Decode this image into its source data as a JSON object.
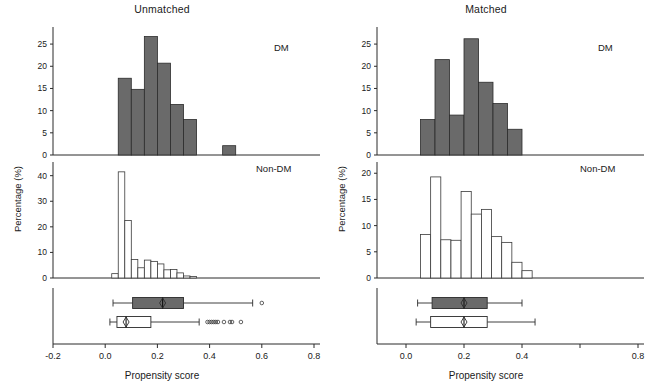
{
  "figure": {
    "xlabel": "Propensity score",
    "ylabel": "Percentage (%)",
    "group_dm": "DM",
    "group_nondm": "Non-DM"
  },
  "panels": [
    {
      "key": "unmatched",
      "title": "Unmatched",
      "xlim": [
        -0.2,
        0.8
      ],
      "xticks": [
        -0.2,
        0.0,
        0.2,
        0.4,
        0.6,
        0.8
      ],
      "xticklabels": [
        "-0.2",
        "0.0",
        "0.2",
        "0.4",
        "0.6",
        "0.8"
      ],
      "hist_dm": {
        "ylim": [
          0,
          27.5
        ],
        "yticks": [
          0,
          5,
          10,
          15,
          20,
          25
        ],
        "yticklabels": [
          "0",
          "5",
          "10",
          "15",
          "20",
          "25"
        ],
        "bin_width": 0.05,
        "bins_left": [
          0.05,
          0.1,
          0.15,
          0.2,
          0.25,
          0.3,
          0.45
        ],
        "values": [
          17.3,
          14.8,
          26.7,
          20.7,
          11.4,
          8.0,
          2.1
        ]
      },
      "hist_nondm": {
        "ylim": [
          0,
          43
        ],
        "yticks": [
          0,
          10,
          20,
          30,
          40
        ],
        "yticklabels": [
          "0",
          "10",
          "20",
          "30",
          "40"
        ],
        "bin_width": 0.025,
        "bins_left": [
          0.025,
          0.05,
          0.075,
          0.1,
          0.125,
          0.15,
          0.175,
          0.2,
          0.225,
          0.25,
          0.275,
          0.3,
          0.325
        ],
        "values": [
          1.7,
          41.5,
          22.5,
          7.2,
          4.0,
          7.0,
          6.5,
          5.5,
          3.2,
          3.3,
          2.0,
          0.8,
          0.6
        ]
      },
      "box_dm": {
        "whisker_low": 0.03,
        "q1": 0.105,
        "median": 0.22,
        "q3": 0.3,
        "whisker_high": 0.565,
        "outliers": [
          0.6
        ]
      },
      "box_nondm": {
        "whisker_low": 0.018,
        "q1": 0.045,
        "median": 0.08,
        "q3": 0.175,
        "whisker_high": 0.36,
        "outliers": [
          0.392,
          0.4,
          0.408,
          0.416,
          0.424,
          0.432,
          0.455,
          0.478,
          0.486,
          0.52
        ]
      }
    },
    {
      "key": "matched",
      "title": "Matched",
      "xlim": [
        -0.1,
        0.8
      ],
      "xticks": [
        0.0,
        0.2,
        0.4,
        0.6,
        0.8
      ],
      "xticklabels": [
        "0.0",
        "0.2",
        "0.4",
        "",
        "0.8"
      ],
      "hist_dm": {
        "ylim": [
          0,
          27.5
        ],
        "yticks": [
          0,
          5,
          10,
          15,
          20,
          25
        ],
        "yticklabels": [
          "0",
          "5",
          "10",
          "15",
          "20",
          "25"
        ],
        "bin_width": 0.05,
        "bins_left": [
          0.05,
          0.1,
          0.15,
          0.2,
          0.25,
          0.3,
          0.35
        ],
        "values": [
          8.0,
          21.5,
          9.0,
          26.2,
          16.4,
          11.6,
          5.8
        ]
      },
      "hist_nondm": {
        "ylim": [
          0,
          21
        ],
        "yticks": [
          0,
          5,
          10,
          15,
          20
        ],
        "yticklabels": [
          "0",
          "5",
          "10",
          "15",
          "20"
        ],
        "bin_width": 0.035,
        "bins_left": [
          0.05,
          0.085,
          0.12,
          0.155,
          0.19,
          0.225,
          0.26,
          0.295,
          0.33,
          0.365,
          0.4
        ],
        "values": [
          8.3,
          19.3,
          7.3,
          7.2,
          16.5,
          12.2,
          13.1,
          7.9,
          6.8,
          3.0,
          1.4
        ]
      },
      "box_dm": {
        "whisker_low": 0.04,
        "q1": 0.09,
        "median": 0.2,
        "q3": 0.28,
        "whisker_high": 0.4,
        "outliers": []
      },
      "box_nondm": {
        "whisker_low": 0.035,
        "q1": 0.085,
        "median": 0.2,
        "q3": 0.28,
        "whisker_high": 0.445,
        "outliers": []
      }
    }
  ],
  "chart_data": {
    "type": "bar",
    "xlabel": "Propensity score",
    "ylabel": "Percentage (%)",
    "grid": false,
    "legend": "in-plot text tags (DM / Non-DM)",
    "subplots": [
      {
        "panel": "Unmatched",
        "row": "DM",
        "type": "bar",
        "xlim": [
          -0.2,
          0.8
        ],
        "ylim": [
          0,
          27.5
        ],
        "bin_width": 0.05,
        "categories": [
          "0.05-0.10",
          "0.10-0.15",
          "0.15-0.20",
          "0.20-0.25",
          "0.25-0.30",
          "0.30-0.35",
          "0.45-0.50"
        ],
        "values": [
          17.3,
          14.8,
          26.7,
          20.7,
          11.4,
          8.0,
          2.1
        ]
      },
      {
        "panel": "Unmatched",
        "row": "Non-DM",
        "type": "bar",
        "xlim": [
          -0.2,
          0.8
        ],
        "ylim": [
          0,
          43
        ],
        "bin_width": 0.025,
        "categories": [
          "0.025",
          "0.050",
          "0.075",
          "0.100",
          "0.125",
          "0.150",
          "0.175",
          "0.200",
          "0.225",
          "0.250",
          "0.275",
          "0.300",
          "0.325"
        ],
        "values": [
          1.7,
          41.5,
          22.5,
          7.2,
          4.0,
          7.0,
          6.5,
          5.5,
          3.2,
          3.3,
          2.0,
          0.8,
          0.6
        ]
      },
      {
        "panel": "Matched",
        "row": "DM",
        "type": "bar",
        "xlim": [
          -0.1,
          0.8
        ],
        "ylim": [
          0,
          27.5
        ],
        "bin_width": 0.05,
        "categories": [
          "0.05-0.10",
          "0.10-0.15",
          "0.15-0.20",
          "0.20-0.25",
          "0.25-0.30",
          "0.30-0.35",
          "0.35-0.40"
        ],
        "values": [
          8.0,
          21.5,
          9.0,
          26.2,
          16.4,
          11.6,
          5.8
        ]
      },
      {
        "panel": "Matched",
        "row": "Non-DM",
        "type": "bar",
        "xlim": [
          -0.1,
          0.8
        ],
        "ylim": [
          0,
          21
        ],
        "bin_width": 0.035,
        "categories": [
          "0.050",
          "0.085",
          "0.120",
          "0.155",
          "0.190",
          "0.225",
          "0.260",
          "0.295",
          "0.330",
          "0.365",
          "0.400"
        ],
        "values": [
          8.3,
          19.3,
          7.3,
          7.2,
          16.5,
          12.2,
          13.1,
          7.9,
          6.8,
          3.0,
          1.4
        ]
      }
    ],
    "boxplots": [
      {
        "panel": "Unmatched",
        "row": "DM",
        "whisker_low": 0.03,
        "q1": 0.105,
        "median": 0.22,
        "q3": 0.3,
        "whisker_high": 0.565,
        "outliers": [
          0.6
        ]
      },
      {
        "panel": "Unmatched",
        "row": "Non-DM",
        "whisker_low": 0.018,
        "q1": 0.045,
        "median": 0.08,
        "q3": 0.175,
        "whisker_high": 0.36,
        "outliers": [
          0.392,
          0.4,
          0.408,
          0.416,
          0.424,
          0.432,
          0.455,
          0.478,
          0.486,
          0.52
        ]
      },
      {
        "panel": "Matched",
        "row": "DM",
        "whisker_low": 0.04,
        "q1": 0.09,
        "median": 0.2,
        "q3": 0.28,
        "whisker_high": 0.4,
        "outliers": []
      },
      {
        "panel": "Matched",
        "row": "Non-DM",
        "whisker_low": 0.035,
        "q1": 0.085,
        "median": 0.2,
        "q3": 0.28,
        "whisker_high": 0.445,
        "outliers": []
      }
    ]
  }
}
